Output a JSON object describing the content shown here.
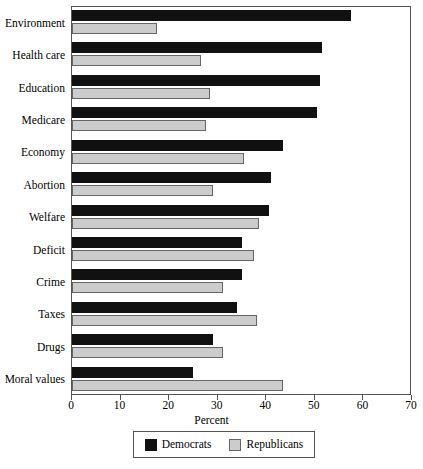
{
  "chart_data": {
    "type": "bar",
    "orientation": "horizontal",
    "title": "",
    "xlabel": "Percent",
    "ylabel": "",
    "xlim": [
      0,
      70
    ],
    "xticks": [
      0,
      10,
      20,
      30,
      40,
      50,
      60,
      70
    ],
    "grid": false,
    "legend_position": "bottom",
    "categories": [
      "Environment",
      "Health care",
      "Education",
      "Medicare",
      "Economy",
      "Abortion",
      "Welfare",
      "Deficit",
      "Crime",
      "Taxes",
      "Drugs",
      "Moral values"
    ],
    "series": [
      {
        "name": "Democrats",
        "color": "#111111",
        "values": [
          57.5,
          51.5,
          51,
          50.5,
          43.5,
          41,
          40.5,
          35,
          35,
          34,
          29,
          25
        ]
      },
      {
        "name": "Republicans",
        "color": "#cccccc",
        "values": [
          17.5,
          26.5,
          28.5,
          27.5,
          35.5,
          29,
          38.5,
          37.5,
          31,
          38,
          31,
          43.5
        ]
      }
    ]
  }
}
